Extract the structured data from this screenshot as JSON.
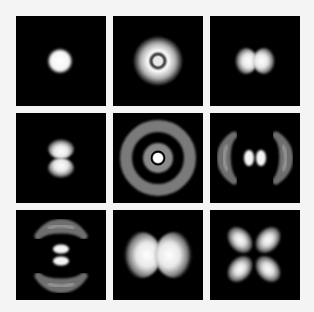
{
  "figure": {
    "background_color": "#f4f4f4",
    "panel_color": "#000000",
    "grid": {
      "rows": 3,
      "cols": 3,
      "panel_size": 90,
      "gap": 7,
      "origin": [
        16,
        16
      ]
    },
    "panels": [
      {
        "id": "p1",
        "row": 0,
        "col": 0,
        "shape": "single-sphere",
        "label": ""
      },
      {
        "id": "p2",
        "row": 0,
        "col": 1,
        "shape": "sphere-with-radial-node",
        "label": ""
      },
      {
        "id": "p3",
        "row": 0,
        "col": 2,
        "shape": "two-lobes-horizontal",
        "label": ""
      },
      {
        "id": "p4",
        "row": 1,
        "col": 0,
        "shape": "two-lobes-vertical",
        "label": ""
      },
      {
        "id": "p5",
        "row": 1,
        "col": 1,
        "shape": "concentric-rings",
        "label": ""
      },
      {
        "id": "p6",
        "row": 1,
        "col": 2,
        "shape": "two-lobes-horizontal-with-outer-crescents",
        "label": ""
      },
      {
        "id": "p7",
        "row": 2,
        "col": 0,
        "shape": "two-lobes-vertical-with-outer-crescents",
        "label": ""
      },
      {
        "id": "p8",
        "row": 2,
        "col": 1,
        "shape": "large-two-lobes-horizontal",
        "label": ""
      },
      {
        "id": "p9",
        "row": 2,
        "col": 2,
        "shape": "four-lobes-diagonal",
        "label": ""
      }
    ]
  }
}
